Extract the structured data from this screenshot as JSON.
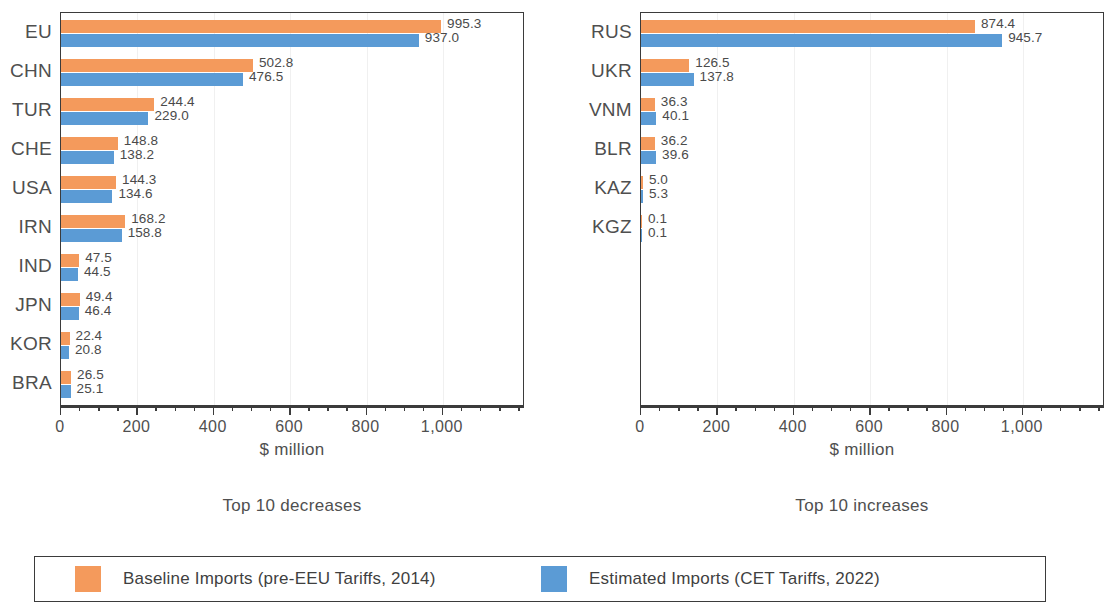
{
  "axis": {
    "title": "$ million",
    "tick_labels": [
      "0",
      "200",
      "400",
      "600",
      "800",
      "1,000"
    ],
    "tick_values": [
      0,
      200,
      400,
      600,
      800,
      1000
    ],
    "minor_step": 50,
    "xmin": 0,
    "xmax": 1215
  },
  "panels": {
    "left": {
      "caption": "Top 10 decreases"
    },
    "right": {
      "caption": "Top 10 increases"
    }
  },
  "legend": {
    "baseline_label": "Baseline Imports (pre-EEU Tariffs, 2014)",
    "estimated_label": "Estimated Imports (CET Tariffs, 2022)",
    "baseline_color": "#f49a5c",
    "estimated_color": "#5b9bd5"
  },
  "chart_data": [
    {
      "type": "bar",
      "title": "Top 10 decreases",
      "orientation": "horizontal",
      "xlabel": "$ million",
      "ylabel": "",
      "xlim": [
        0,
        1215
      ],
      "grid": false,
      "categories": [
        "EU",
        "CHN",
        "TUR",
        "CHE",
        "USA",
        "IRN",
        "IND",
        "JPN",
        "KOR",
        "BRA"
      ],
      "series": [
        {
          "name": "Baseline Imports (pre-EEU Tariffs, 2014)",
          "color": "#f49a5c",
          "values": [
            995.3,
            502.8,
            244.4,
            148.8,
            144.3,
            168.2,
            47.5,
            49.4,
            22.4,
            26.5
          ],
          "labels": [
            "995.3",
            "502.8",
            "244.4",
            "148.8",
            "144.3",
            "168.2",
            "47.5",
            "49.4",
            "22.4",
            "26.5"
          ]
        },
        {
          "name": "Estimated Imports (CET Tariffs, 2022)",
          "color": "#5b9bd5",
          "values": [
            937.0,
            476.5,
            229.0,
            138.2,
            134.6,
            158.8,
            44.5,
            46.4,
            20.8,
            25.1
          ],
          "labels": [
            "937.0",
            "476.5",
            "229.0",
            "138.2",
            "134.6",
            "158.8",
            "44.5",
            "46.4",
            "20.8",
            "25.1"
          ]
        }
      ]
    },
    {
      "type": "bar",
      "title": "Top 10 increases",
      "orientation": "horizontal",
      "xlabel": "$ million",
      "ylabel": "",
      "xlim": [
        0,
        1215
      ],
      "grid": false,
      "categories": [
        "RUS",
        "UKR",
        "VNM",
        "BLR",
        "KAZ",
        "KGZ"
      ],
      "series": [
        {
          "name": "Baseline Imports (pre-EEU Tariffs, 2014)",
          "color": "#f49a5c",
          "values": [
            874.4,
            126.5,
            36.3,
            36.2,
            5.0,
            0.1
          ],
          "labels": [
            "874.4",
            "126.5",
            "36.3",
            "36.2",
            "5.0",
            "0.1"
          ]
        },
        {
          "name": "Estimated Imports (CET Tariffs, 2022)",
          "color": "#5b9bd5",
          "values": [
            945.7,
            137.8,
            40.1,
            39.6,
            5.3,
            0.1
          ],
          "labels": [
            "945.7",
            "137.8",
            "40.1",
            "39.6",
            "5.3",
            "0.1"
          ]
        }
      ]
    }
  ]
}
